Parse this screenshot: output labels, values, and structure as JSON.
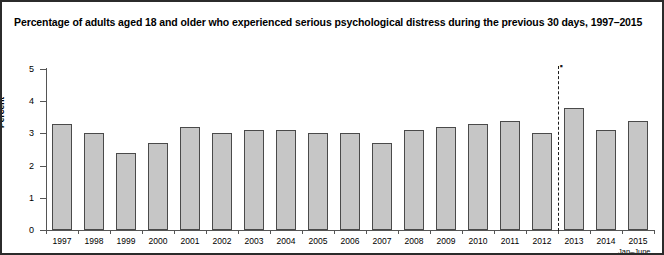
{
  "figure": {
    "title": "Percentage of adults aged 18 and older who experienced serious psychological distress during the previous 30 days, 1997–2015",
    "border_color": "#2b2b2b",
    "background": "#ffffff"
  },
  "axes": {
    "ylabel": "Percent",
    "yticks": [
      "0",
      "1",
      "2",
      "3",
      "4",
      "5"
    ],
    "ymin": 0,
    "ymax": 5
  },
  "annotations": {
    "break_marker": "▪",
    "footnote": "Jan–June"
  },
  "chart_data": {
    "type": "bar",
    "title": "Percentage of adults aged 18 and older who experienced serious psychological distress during the previous 30 days, 1997–2015",
    "xlabel": "",
    "ylabel": "Percent",
    "ylim": [
      0,
      5
    ],
    "ytick_values": [
      0,
      1,
      2,
      3,
      4,
      5
    ],
    "grid": false,
    "legend": false,
    "bar_color": "#c6c6c6",
    "bar_edge_color": "#4a4a4a",
    "categories": [
      "1997",
      "1998",
      "1999",
      "2000",
      "2001",
      "2002",
      "2003",
      "2004",
      "2005",
      "2006",
      "2007",
      "2008",
      "2009",
      "2010",
      "2011",
      "2012",
      "2013",
      "2014",
      "2015"
    ],
    "values": [
      3.3,
      3.0,
      2.4,
      2.7,
      3.2,
      3.0,
      3.1,
      3.1,
      3.0,
      3.0,
      2.7,
      3.1,
      3.2,
      3.3,
      3.4,
      3.0,
      3.8,
      3.1,
      3.4
    ],
    "annotations": [
      {
        "type": "vline",
        "style": "dashed",
        "between": [
          "2012",
          "2013"
        ],
        "marker": "▪"
      },
      {
        "type": "note",
        "text": "Jan–June",
        "attached_to": "2015"
      }
    ]
  }
}
